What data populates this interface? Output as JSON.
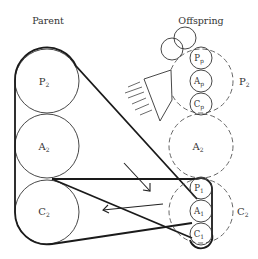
{
  "headings": {
    "parent": "Parent",
    "offspring": "Offspring"
  },
  "parent": {
    "circles": [
      {
        "label": "P",
        "sub": "2"
      },
      {
        "label": "A",
        "sub": "2"
      },
      {
        "label": "C",
        "sub": "2"
      }
    ]
  },
  "offspring": {
    "upper_group": {
      "outer_label": "P",
      "outer_sub": "2",
      "inner": [
        {
          "label": "P",
          "sub": "p"
        },
        {
          "label": "A",
          "sub": "p"
        },
        {
          "label": "C",
          "sub": "p"
        }
      ]
    },
    "middle": {
      "label": "A",
      "sub": "2"
    },
    "lower_group": {
      "outer_label": "C",
      "outer_sub": "2",
      "inner": [
        {
          "label": "P",
          "sub": "1"
        },
        {
          "label": "A",
          "sub": "1"
        },
        {
          "label": "C",
          "sub": "1"
        }
      ]
    }
  },
  "colors": {
    "stroke": "#222222",
    "dashed": "#555555",
    "text": "#333333"
  }
}
